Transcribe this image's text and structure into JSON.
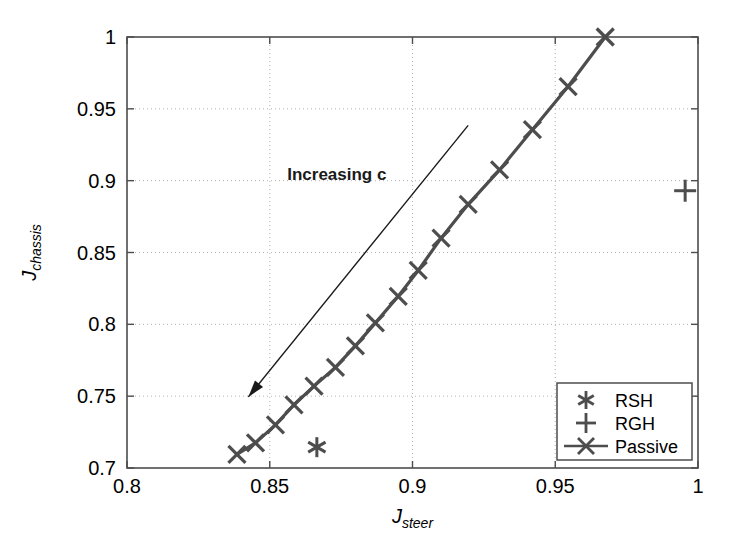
{
  "figure": {
    "background_color": "#ffffff",
    "axes_color": "#4d4d4d",
    "grid_color": "#b3b3b3",
    "data_color": "#4d4d4d"
  },
  "chart_data": {
    "type": "scatter",
    "title": "",
    "xlabel": "J_steer",
    "ylabel": "J_chassis",
    "xlabel_main": "J",
    "xlabel_sub": "steer",
    "ylabel_main": "J",
    "ylabel_sub": "chassis",
    "xlim": [
      0.8,
      1.0
    ],
    "ylim": [
      0.7,
      1.0
    ],
    "xticks": [
      0.8,
      0.85,
      0.9,
      0.95,
      1
    ],
    "xticklabels": [
      "0.8",
      "0.85",
      "0.9",
      "0.95",
      "1"
    ],
    "yticks": [
      0.7,
      0.75,
      0.8,
      0.85,
      0.9,
      0.95,
      1
    ],
    "yticklabels": [
      "0.7",
      "0.75",
      "0.8",
      "0.85",
      "0.9",
      "0.95",
      "1"
    ],
    "grid": true,
    "grid_style": "dotted",
    "legend_position": "lower right",
    "series": [
      {
        "name": "RSH",
        "marker": "asterisk",
        "line": "none",
        "points": [
          [
            0.8665,
            0.7145
          ]
        ]
      },
      {
        "name": "RGH",
        "marker": "plus",
        "line": "none",
        "points": [
          [
            0.9955,
            0.893
          ]
        ]
      },
      {
        "name": "Passive",
        "marker": "cross",
        "line": "solid",
        "points": [
          [
            0.8385,
            0.7095
          ],
          [
            0.845,
            0.7175
          ],
          [
            0.852,
            0.73
          ],
          [
            0.8585,
            0.744
          ],
          [
            0.8655,
            0.757
          ],
          [
            0.873,
            0.77
          ],
          [
            0.88,
            0.785
          ],
          [
            0.887,
            0.801
          ],
          [
            0.895,
            0.8195
          ],
          [
            0.902,
            0.8375
          ],
          [
            0.91,
            0.86
          ],
          [
            0.9195,
            0.8835
          ],
          [
            0.9305,
            0.9075
          ],
          [
            0.942,
            0.9355
          ],
          [
            0.9545,
            0.9655
          ],
          [
            0.9675,
            1.0
          ]
        ]
      }
    ],
    "annotations": [
      {
        "text": "Increasing c",
        "text_x": 0.8735,
        "text_y": 0.9005,
        "arrow_from": [
          0.9195,
          0.9385
        ],
        "arrow_to": [
          0.8425,
          0.7495
        ]
      }
    ],
    "legend_entries": [
      {
        "label": "RSH",
        "marker": "asterisk",
        "line": false
      },
      {
        "label": "RGH",
        "marker": "plus",
        "line": false
      },
      {
        "label": "Passive",
        "marker": "cross",
        "line": true
      }
    ]
  }
}
